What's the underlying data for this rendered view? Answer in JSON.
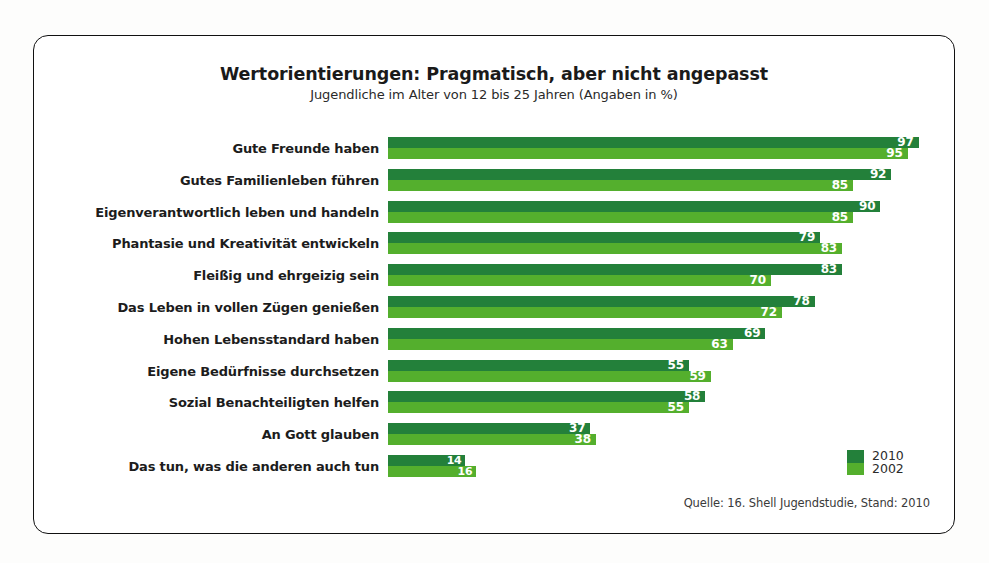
{
  "header": {
    "title": "Wertorientierungen: Pragmatisch, aber nicht angepasst",
    "subtitle": "Jugendliche im Alter von 12 bis 25 Jahren (Angaben in %)"
  },
  "legend": {
    "series_2010_label": "2010",
    "series_2002_label": "2002",
    "swatch_2010_color": "#23803a",
    "swatch_2002_color": "#54af2d"
  },
  "source": "Quelle: 16. Shell Jugendstudie, Stand: 2010",
  "chart_data": {
    "type": "bar",
    "orientation": "horizontal",
    "title": "Wertorientierungen: Pragmatisch, aber nicht angepasst",
    "subtitle": "Jugendliche im Alter von 12 bis 25 Jahren (Angaben in %)",
    "xlabel": "",
    "ylabel": "",
    "xlim": [
      0,
      100
    ],
    "grid": false,
    "legend_position": "bottom-right",
    "value_suffix": "%",
    "categories": [
      "Gute Freunde haben",
      "Gutes Familienleben führen",
      "Eigenverantwortlich leben und handeln",
      "Phantasie und Kreativität entwickeln",
      "Fleißig und ehrgeizig sein",
      "Das Leben in vollen Zügen genießen",
      "Hohen Lebensstandard haben",
      "Eigene Bedürfnisse durchsetzen",
      "Sozial Benachteiligten helfen",
      "An Gott glauben",
      "Das tun, was die anderen auch tun"
    ],
    "series": [
      {
        "name": "2010",
        "color": "#23803a",
        "values": [
          97,
          92,
          90,
          79,
          83,
          78,
          69,
          55,
          58,
          37,
          14
        ]
      },
      {
        "name": "2002",
        "color": "#54af2d",
        "values": [
          95,
          85,
          85,
          83,
          70,
          72,
          63,
          59,
          55,
          38,
          16
        ]
      }
    ]
  }
}
